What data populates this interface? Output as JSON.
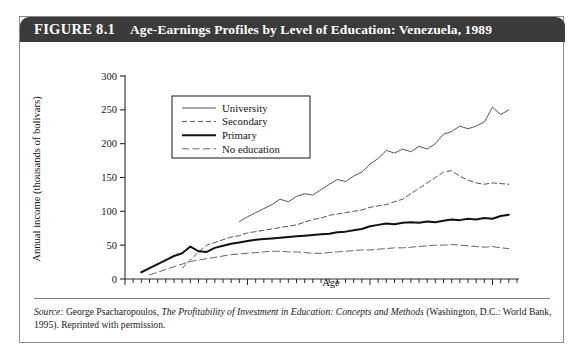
{
  "figure": {
    "number_label": "FIGURE 8.1",
    "title": "Age-Earnings Profiles by Level of Education: Venezuela, 1989"
  },
  "source": {
    "prefix": "Source:",
    "author": "George Psacharopoulos,",
    "work_title": "The Profitability of Investment in Education: Concepts and Methods",
    "publisher": "(Washington, D.C.: World Bank, 1995). Reprinted with permission."
  },
  "colors": {
    "header_background": "#3b3b3b",
    "header_text": "#ffffff",
    "card_border": "#8a8a8a",
    "axis": "#2b2b2b",
    "university_line": "#555555",
    "secondary_line": "#555555",
    "primary_line": "#111111",
    "noeducation_line": "#666666",
    "page_background": "#ffffff"
  },
  "chart_data": {
    "type": "line",
    "title": "Age-Earnings Profiles by Level of Education: Venezuela, 1989",
    "xlabel": "Age",
    "ylabel": "Annual income (thousands of bolivars)",
    "xlim": [
      10,
      58
    ],
    "ylim": [
      0,
      300
    ],
    "xticks": [
      10,
      25,
      40,
      55
    ],
    "xtick_labels": [
      "10",
      "25",
      "40",
      "55"
    ],
    "yticks": [
      0,
      50,
      100,
      150,
      200,
      250,
      300
    ],
    "ytick_labels": [
      "0",
      "50",
      "100",
      "150",
      "200",
      "250",
      "300"
    ],
    "x_minor_tick_step": 1,
    "grid": false,
    "legend_position": "upper-left-inset",
    "series": [
      {
        "name": "University",
        "style": "solid-thin",
        "x": [
          24,
          25,
          26,
          27,
          28,
          29,
          30,
          31,
          32,
          33,
          34,
          35,
          36,
          37,
          38,
          39,
          40,
          41,
          42,
          43,
          44,
          45,
          46,
          47,
          48,
          49,
          50,
          51,
          52,
          53,
          54,
          55,
          56,
          57
        ],
        "y": [
          85,
          92,
          98,
          104,
          110,
          118,
          114,
          122,
          126,
          124,
          132,
          140,
          147,
          144,
          152,
          158,
          170,
          178,
          190,
          186,
          192,
          188,
          196,
          192,
          200,
          214,
          218,
          226,
          222,
          226,
          232,
          254,
          243,
          250
        ]
      },
      {
        "name": "Secondary",
        "style": "dashed",
        "x": [
          17,
          18,
          19,
          20,
          21,
          22,
          23,
          24,
          25,
          26,
          27,
          28,
          29,
          30,
          31,
          32,
          33,
          34,
          35,
          36,
          37,
          38,
          39,
          40,
          41,
          42,
          43,
          44,
          45,
          46,
          47,
          48,
          49,
          50,
          51,
          52,
          53,
          54,
          55,
          56,
          57
        ],
        "y": [
          16,
          28,
          40,
          50,
          54,
          58,
          62,
          64,
          68,
          70,
          72,
          74,
          76,
          78,
          80,
          84,
          88,
          90,
          94,
          96,
          98,
          100,
          102,
          106,
          108,
          110,
          114,
          118,
          126,
          134,
          142,
          150,
          158,
          160,
          152,
          146,
          142,
          140,
          142,
          141,
          140
        ]
      },
      {
        "name": "Primary",
        "style": "solid-thick",
        "x": [
          12,
          13,
          14,
          15,
          16,
          17,
          18,
          19,
          20,
          21,
          22,
          23,
          24,
          25,
          26,
          27,
          28,
          29,
          30,
          31,
          32,
          33,
          34,
          35,
          36,
          37,
          38,
          39,
          40,
          41,
          42,
          43,
          44,
          45,
          46,
          47,
          48,
          49,
          50,
          51,
          52,
          53,
          54,
          55,
          56,
          57
        ],
        "y": [
          10,
          16,
          22,
          28,
          34,
          38,
          48,
          41,
          40,
          46,
          49,
          52,
          54,
          56,
          58,
          59,
          60,
          61,
          62,
          63,
          64,
          65,
          66,
          67,
          69,
          70,
          72,
          74,
          78,
          80,
          82,
          81,
          83,
          84,
          83,
          85,
          84,
          86,
          88,
          87,
          89,
          88,
          90,
          89,
          93,
          95
        ]
      },
      {
        "name": "No education",
        "style": "dash-dot",
        "x": [
          13,
          14,
          15,
          16,
          17,
          18,
          19,
          20,
          21,
          22,
          23,
          24,
          25,
          26,
          27,
          28,
          29,
          30,
          31,
          32,
          33,
          34,
          35,
          36,
          37,
          38,
          39,
          40,
          41,
          42,
          43,
          44,
          45,
          46,
          47,
          48,
          49,
          50,
          51,
          52,
          53,
          54,
          55,
          56,
          57
        ],
        "y": [
          6,
          10,
          14,
          18,
          22,
          26,
          28,
          30,
          32,
          34,
          36,
          37,
          38,
          39,
          40,
          41,
          41,
          40,
          40,
          39,
          38,
          38,
          39,
          40,
          41,
          42,
          43,
          43,
          44,
          45,
          46,
          46,
          47,
          48,
          49,
          50,
          50,
          51,
          50,
          49,
          48,
          47,
          48,
          46,
          45
        ]
      }
    ],
    "legend_entries": [
      {
        "label": "University",
        "style": "solid-thin"
      },
      {
        "label": "Secondary",
        "style": "dashed"
      },
      {
        "label": "Primary",
        "style": "solid-thick"
      },
      {
        "label": "No education",
        "style": "dash-dot"
      }
    ]
  }
}
